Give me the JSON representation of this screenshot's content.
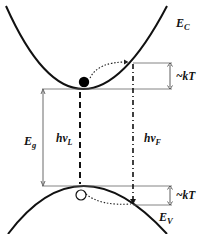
{
  "diagram": {
    "labels": {
      "conduction_band": "E",
      "conduction_band_sub": "C",
      "valence_band": "E",
      "valence_band_sub": "V",
      "band_gap": "E",
      "band_gap_sub": "g",
      "laser_photon": "hν",
      "laser_photon_sub": "L",
      "fluorescence_photon": "hν",
      "fluorescence_photon_sub": "F",
      "thermal_upper": "~kT",
      "thermal_lower": "~kT"
    },
    "elements": {
      "electron": "filled-circle",
      "hole": "open-circle"
    },
    "colors": {
      "line": "#111111",
      "thin_line": "#555555",
      "background": "#ffffff"
    }
  }
}
